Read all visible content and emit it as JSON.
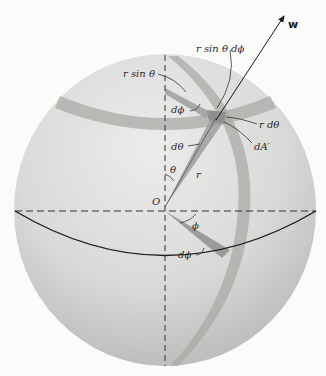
{
  "diagram": {
    "colors": {
      "background": "#fbfbfa",
      "sphere_light": "#e6e6e4",
      "sphere_dark": "#b9b9b7",
      "band": "#a9a9a7",
      "line": "#222222"
    },
    "labels": {
      "w": "w",
      "r_sin_theta_dphi": "r sin θ dϕ",
      "r_sin_theta": "r sin θ",
      "dphi_top": "dϕ",
      "r_dtheta": "r dθ",
      "dA_prime": "dA′",
      "dtheta": "dθ",
      "theta": "θ",
      "r": "r",
      "origin": "O",
      "phi": "ϕ",
      "dphi_bottom": "dϕ"
    }
  }
}
